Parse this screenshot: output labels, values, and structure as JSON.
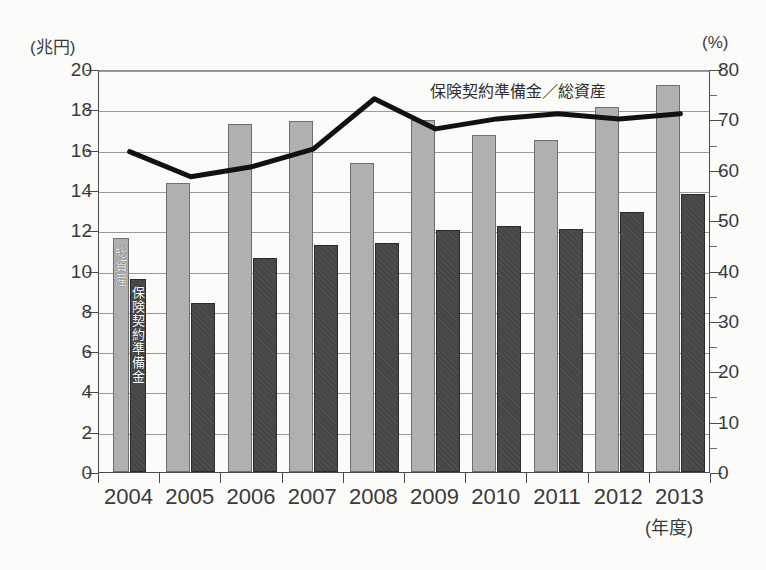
{
  "chart_data": {
    "type": "bar",
    "title": "",
    "subtitle": "",
    "categories": [
      "2004",
      "2005",
      "2006",
      "2007",
      "2008",
      "2009",
      "2010",
      "2011",
      "2012",
      "2013"
    ],
    "xlabel": "(年度)",
    "ylabel_left": "(兆円)",
    "ylabel_right": "(%)",
    "ylim_left": [
      0,
      20
    ],
    "ylim_right": [
      0,
      80
    ],
    "yticks_left": [
      0,
      2,
      4,
      6,
      8,
      10,
      12,
      14,
      16,
      18,
      20
    ],
    "yticks_right": [
      0,
      10,
      20,
      30,
      40,
      50,
      60,
      70,
      80
    ],
    "grid": true,
    "legend_position": "in-plot-first-category",
    "series": [
      {
        "name": "総資産",
        "type": "bar",
        "axis": "left",
        "unit": "兆円",
        "color": "#b0b0b0",
        "values": [
          11.6,
          14.35,
          17.25,
          17.4,
          15.35,
          17.45,
          16.75,
          16.5,
          18.1,
          19.2
        ]
      },
      {
        "name": "保険契約準備金",
        "type": "bar",
        "axis": "left",
        "unit": "兆円",
        "color": "#464646",
        "values": [
          9.6,
          8.4,
          10.6,
          11.25,
          11.35,
          12.0,
          12.2,
          12.05,
          12.9,
          13.8
        ]
      },
      {
        "name": "保険契約準備金／総資産",
        "type": "line",
        "axis": "right",
        "unit": "%",
        "color": "#111111",
        "values": [
          64.0,
          59.0,
          61.0,
          64.5,
          74.5,
          68.5,
          70.5,
          71.5,
          70.5,
          71.5
        ]
      }
    ],
    "annotations": [
      {
        "text": "保険契約準備金／総資産",
        "target_series": "保険契約準備金／総資産"
      }
    ]
  },
  "legend": {
    "total_assets_label": "総資産",
    "reserve_label": "保険契約準備金"
  },
  "colors": {
    "total_assets": "#b0b0b0",
    "reserve": "#464646",
    "line": "#111111",
    "grid": "#9a9a9a",
    "axis": "#4a4a4a",
    "background": "#fbfbfa"
  }
}
